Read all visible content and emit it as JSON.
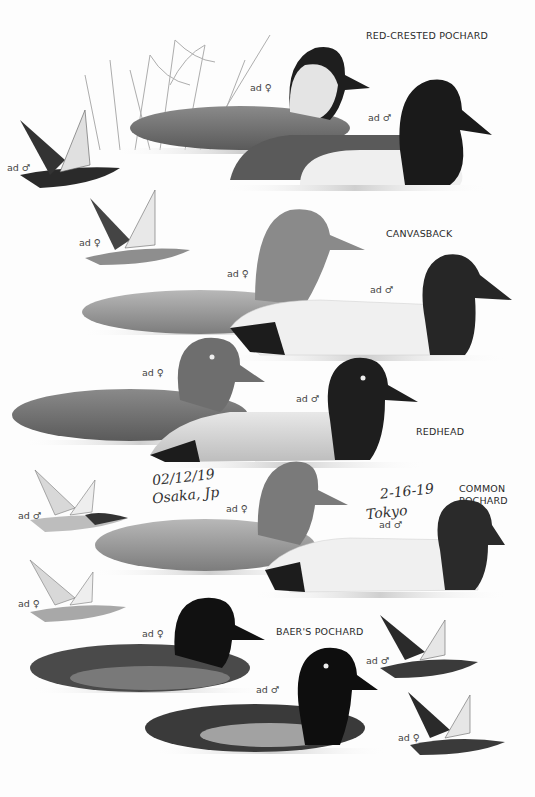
{
  "species": [
    {
      "name": "RED-CRESTED POCHARD",
      "labels": [
        "ad ♀",
        "ad ♂",
        "ad ♂",
        "ad ♀"
      ]
    },
    {
      "name": "CANVASBACK",
      "labels": [
        "ad ♀",
        "ad ♂"
      ]
    },
    {
      "name": "REDHEAD",
      "labels": [
        "ad ♀",
        "ad ♂"
      ]
    },
    {
      "name": "COMMON POCHARD",
      "name_line1": "COMMON",
      "name_line2": "POCHARD",
      "labels": [
        "ad ♂",
        "ad ♀",
        "ad ♀",
        "ad ♂"
      ]
    },
    {
      "name": "BAER'S POCHARD",
      "labels": [
        "ad ♀",
        "ad ♂",
        "ad ♂",
        "ad ♀"
      ]
    }
  ],
  "handwritten_notes": [
    {
      "date": "02/12/19",
      "place": "Osaka, Jp"
    },
    {
      "date": "2-16-19",
      "place": "Tokyo"
    }
  ]
}
